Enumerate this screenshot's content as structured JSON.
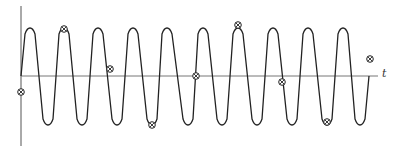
{
  "diagram": {
    "title": "",
    "axis": {
      "t_label": "t",
      "origin": [
        21,
        76
      ],
      "vertical_axis": {
        "x": 21,
        "y_top": 6,
        "y_bottom": 146
      },
      "horizontal_axis": {
        "y": 76,
        "x_start": 21,
        "x_end": 378
      }
    },
    "waveform": {
      "type": "periodic-oscillation",
      "start": [
        21,
        76
      ],
      "end": [
        369,
        76
      ],
      "peak_y": 28,
      "trough_y": 125,
      "peaks_x": [
        30,
        64,
        98,
        133,
        167,
        203,
        238,
        273,
        308,
        343
      ],
      "troughs_x": [
        48,
        82,
        117,
        152,
        188,
        222,
        257,
        292,
        327,
        360
      ],
      "stroke": "#222222"
    },
    "sample_points": [
      {
        "x": 21,
        "y": 92
      },
      {
        "x": 64,
        "y": 29
      },
      {
        "x": 110,
        "y": 69
      },
      {
        "x": 152,
        "y": 125
      },
      {
        "x": 196,
        "y": 76
      },
      {
        "x": 238,
        "y": 25
      },
      {
        "x": 282,
        "y": 82
      },
      {
        "x": 327,
        "y": 122
      },
      {
        "x": 370,
        "y": 59
      }
    ],
    "sample_marker": "circled-cross"
  }
}
